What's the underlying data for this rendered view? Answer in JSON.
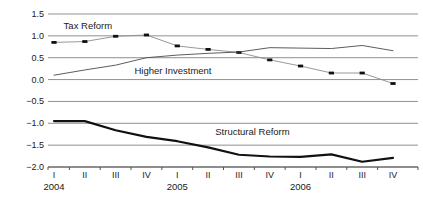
{
  "chart_data": {
    "type": "line",
    "title": "",
    "x_axis": {
      "categories": [
        "I",
        "II",
        "III",
        "IV",
        "I",
        "II",
        "III",
        "IV",
        "I",
        "II",
        "III",
        "IV"
      ],
      "years": [
        {
          "label": "2004",
          "index": 0
        },
        {
          "label": "2005",
          "index": 4
        },
        {
          "label": "2006",
          "index": 8
        }
      ]
    },
    "y_axis": {
      "ticks": [
        {
          "label": "1.5",
          "value": 1.5
        },
        {
          "label": "1.0",
          "value": 1.0
        },
        {
          "label": "0.5",
          "value": 0.5
        },
        {
          "label": "0.0",
          "value": 0.0
        },
        {
          "label": "−0.5",
          "value": -0.5
        },
        {
          "label": "−1.0",
          "value": -1.0
        },
        {
          "label": "−1.5",
          "value": -1.5
        },
        {
          "label": "−2.0",
          "value": -2.0
        }
      ],
      "range": [
        -2.0,
        1.5
      ]
    },
    "series": [
      {
        "name": "Tax Reform",
        "marker": "square",
        "marker_color": "#111111",
        "line_color": "#8c8c8c",
        "line_width": 0.9,
        "values": [
          0.85,
          0.87,
          0.99,
          1.02,
          0.77,
          0.69,
          0.62,
          0.45,
          0.31,
          0.15,
          0.15,
          -0.09
        ]
      },
      {
        "name": "Higher Investment",
        "marker": "none",
        "marker_color": "#4a4a4a",
        "line_color": "#4a4a4a",
        "line_width": 0.9,
        "values": [
          0.1,
          0.22,
          0.33,
          0.5,
          0.56,
          0.6,
          0.63,
          0.73,
          0.72,
          0.71,
          0.78,
          0.66
        ]
      },
      {
        "name": "Structural Reform",
        "marker": "none",
        "marker_color": "#111111",
        "line_color": "#111111",
        "line_width": 2.2,
        "values": [
          -0.95,
          -0.95,
          -1.16,
          -1.31,
          -1.41,
          -1.55,
          -1.72,
          -1.76,
          -1.77,
          -1.71,
          -1.88,
          -1.79
        ]
      }
    ],
    "annotations": [
      {
        "text": "Tax Reform",
        "x": 1.1,
        "y": 1.22
      },
      {
        "text": "Higher Investment",
        "x": 3.86,
        "y": 0.19
      },
      {
        "text": "Structural Reform",
        "x": 6.44,
        "y": -1.21
      }
    ],
    "colors": {
      "grid": "#909090",
      "axis": "#555555",
      "text": "#1a1a1a",
      "background": "#ffffff"
    },
    "legend": "none",
    "grid": "horizontal"
  }
}
